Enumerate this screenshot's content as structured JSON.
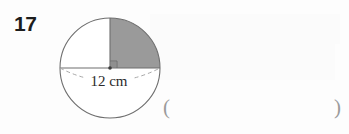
{
  "page": {
    "width": 349,
    "height": 134,
    "background_color": "#fdfdfd"
  },
  "question": {
    "number": "17"
  },
  "figure": {
    "type": "circle-with-shaded-quadrant",
    "shape_name": "circle",
    "diameter_label": "12 cm",
    "diameter_value": 12,
    "diameter_units": "cm",
    "shaded_fraction": "one quarter",
    "shaded_quadrant": "upper-right",
    "shaded_color": "#9a9a9a",
    "outline_color": "#6e6e6e",
    "unshaded_color": "#ffffff",
    "dashed_arc_color": "#a8a8a8",
    "has_right_angle_mark": true,
    "has_centre_dot": true,
    "centre": {
      "x": 58,
      "y": 58
    },
    "radius": 50
  },
  "answer": {
    "open_paren": "(",
    "close_paren": ")",
    "value": "",
    "paren_color": "#9b9b9b"
  }
}
